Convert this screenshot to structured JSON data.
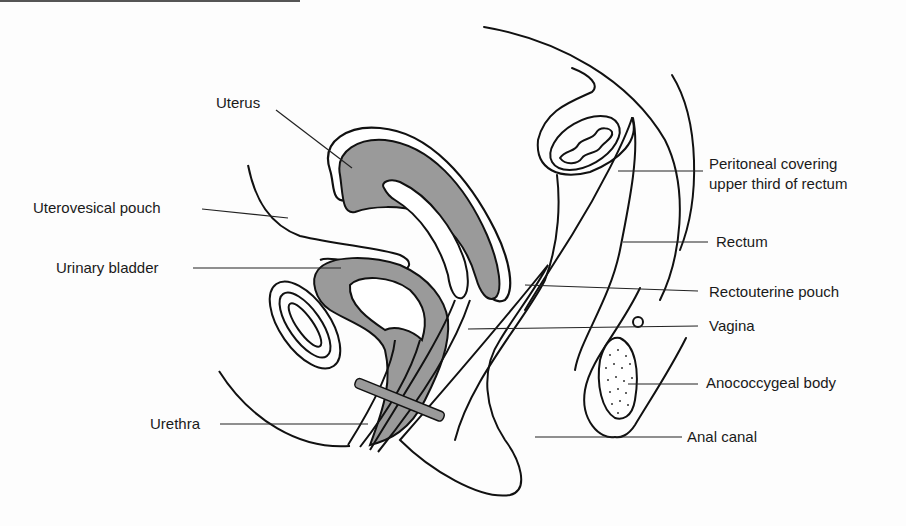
{
  "diagram": {
    "colors": {
      "tissue_fill": "#9a9a9a",
      "outline": "#111111",
      "background": "#fdfdfd"
    },
    "labels": [
      {
        "id": "uterus",
        "text": "Uterus"
      },
      {
        "id": "uterovesical_pouch",
        "text": "Uterovesical pouch"
      },
      {
        "id": "urinary_bladder",
        "text": "Urinary bladder"
      },
      {
        "id": "urethra",
        "text": "Urethra"
      },
      {
        "id": "peritoneal_covering_1",
        "text": "Peritoneal covering"
      },
      {
        "id": "peritoneal_covering_2",
        "text": "upper third of rectum"
      },
      {
        "id": "rectum",
        "text": "Rectum"
      },
      {
        "id": "rectouterine_pouch",
        "text": "Rectouterine pouch"
      },
      {
        "id": "vagina",
        "text": "Vagina"
      },
      {
        "id": "anococcygeal_body",
        "text": "Anococcygeal body"
      },
      {
        "id": "anal_canal",
        "text": "Anal canal"
      }
    ]
  }
}
